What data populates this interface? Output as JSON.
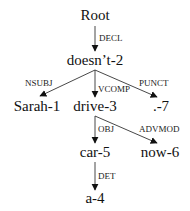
{
  "diagram": {
    "type": "dependency-tree",
    "nodes": [
      {
        "id": "root",
        "label": "Root",
        "x": 95,
        "y": 20
      },
      {
        "id": "n2",
        "label": "doesn’t-2",
        "x": 95,
        "y": 65
      },
      {
        "id": "n1",
        "label": "Sarah-1",
        "x": 37,
        "y": 111
      },
      {
        "id": "n3",
        "label": "drive-3",
        "x": 95,
        "y": 111
      },
      {
        "id": "n7",
        "label": ".-7",
        "x": 161,
        "y": 111
      },
      {
        "id": "n5",
        "label": "car-5",
        "x": 95,
        "y": 157
      },
      {
        "id": "n6",
        "label": "now-6",
        "x": 160,
        "y": 157
      },
      {
        "id": "n4",
        "label": "a-4",
        "x": 95,
        "y": 203
      }
    ],
    "edges": [
      {
        "from": "root",
        "to": "n2",
        "label": "DECL"
      },
      {
        "from": "n2",
        "to": "n1",
        "label": "NSUBJ"
      },
      {
        "from": "n2",
        "to": "n3",
        "label": "VCOMP"
      },
      {
        "from": "n2",
        "to": "n7",
        "label": "PUNCT"
      },
      {
        "from": "n3",
        "to": "n5",
        "label": "OBJ"
      },
      {
        "from": "n3",
        "to": "n6",
        "label": "ADVMOD"
      },
      {
        "from": "n5",
        "to": "n4",
        "label": "DET"
      }
    ]
  }
}
